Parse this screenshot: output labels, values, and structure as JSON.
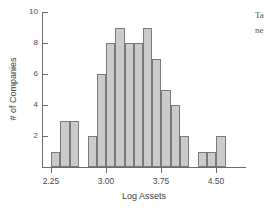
{
  "figure": {
    "background_color": "#ffffff",
    "axis_color": "#6e6e6e",
    "bar_fill_color": "#cbcbcb",
    "bar_edge_color": "#7a7a7a",
    "text_color": "#3d3d3d"
  },
  "margin_text": {
    "line1": "Ta",
    "line2": "ne"
  },
  "chart_data": {
    "type": "bar",
    "title": "",
    "xlabel": "Log Assets",
    "ylabel": "# of Companies",
    "xlim": [
      2.125,
      4.875
    ],
    "ylim": [
      0,
      10
    ],
    "grid": false,
    "legend": null,
    "bin_width": 0.125,
    "x_tick_labels": [
      "2.25",
      "3.00",
      "3.75",
      "4.50"
    ],
    "x_tick_values": [
      2.25,
      3.0,
      3.75,
      4.5
    ],
    "y_tick_labels": [
      "2",
      "4",
      "6",
      "8",
      "10"
    ],
    "y_tick_values": [
      2,
      4,
      6,
      8,
      10
    ],
    "bin_left_edges": [
      2.25,
      2.375,
      2.5,
      2.625,
      2.75,
      2.875,
      3.0,
      3.125,
      3.25,
      3.375,
      3.5,
      3.625,
      3.75,
      3.875,
      4.0,
      4.125,
      4.25,
      4.375,
      4.5,
      4.625
    ],
    "categories": [
      "2.25",
      "2.375",
      "2.50",
      "2.625",
      "2.75",
      "2.875",
      "3.00",
      "3.125",
      "3.25",
      "3.375",
      "3.50",
      "3.625",
      "3.75",
      "3.875",
      "4.00",
      "4.125",
      "4.25",
      "4.375",
      "4.50",
      "4.625"
    ],
    "values": [
      1,
      3,
      3,
      0,
      2,
      6,
      8,
      9,
      8,
      8,
      9,
      7,
      5,
      4,
      2,
      0,
      1,
      1,
      2,
      0
    ]
  }
}
